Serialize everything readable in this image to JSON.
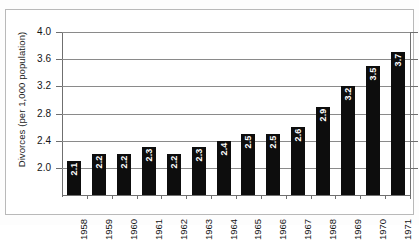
{
  "chart_data": {
    "type": "bar",
    "title": "",
    "subtitle": "",
    "xlabel": "",
    "ylabel": "Divorces (per 1,000 population)",
    "categories": [
      "1958",
      "1959",
      "1960",
      "1961",
      "1962",
      "1963",
      "1964",
      "1965",
      "1966",
      "1967",
      "1968",
      "1969",
      "1970",
      "1971"
    ],
    "values": [
      2.1,
      2.2,
      2.2,
      2.3,
      2.2,
      2.3,
      2.4,
      2.5,
      2.5,
      2.6,
      2.9,
      3.2,
      3.5,
      3.7
    ],
    "value_labels": [
      "2.1",
      "2.2",
      "2.2",
      "2.3",
      "2.2",
      "2.3",
      "2.4",
      "2.5",
      "2.5",
      "2.6",
      "2.9",
      "3.2",
      "3.5",
      "3.7"
    ],
    "ylim": [
      1.6,
      4.0
    ],
    "ytick_values": [
      2.0,
      2.4,
      2.8,
      3.2,
      3.6,
      4.0
    ],
    "ytick_labels": [
      "2.0",
      "2.4",
      "2.8",
      "3.2",
      "3.6",
      "4.0"
    ],
    "grid": true,
    "grid_axis": "y",
    "legend": false,
    "legend_position": "none",
    "bar_color": "#0d0d0d",
    "gridline_color": "#8a8a8a",
    "axis_color": "#6f6f6f",
    "value_label_color": "#ffffff",
    "background_color": "#ffffff",
    "value_label_orientation": "vertical",
    "xtick_label_orientation": "vertical"
  }
}
